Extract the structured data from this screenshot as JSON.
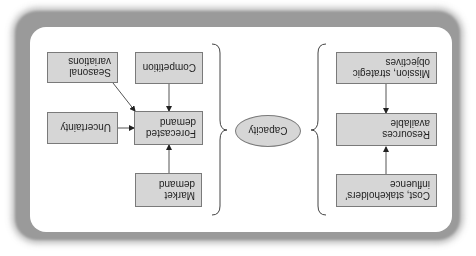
{
  "diagram": {
    "orientation": "rotated 180 degrees",
    "center": {
      "label": "Capacity"
    },
    "supply_side": {
      "boxes": [
        {
          "id": "mission",
          "label": "Mission, strategic objectives"
        },
        {
          "id": "resources",
          "label": "Resources available"
        },
        {
          "id": "cost",
          "label": "Cost, stakeholders' influence"
        }
      ]
    },
    "demand_side": {
      "boxes": [
        {
          "id": "competition",
          "label": "Competition"
        },
        {
          "id": "seasonal",
          "label": "Seasonal variations"
        },
        {
          "id": "uncertainty",
          "label": "Uncertainty"
        },
        {
          "id": "forecasted",
          "label": "Forecasted demand"
        },
        {
          "id": "market",
          "label": "Market demand"
        }
      ]
    },
    "arrows": [
      {
        "from": "Mission, strategic objectives",
        "to": "Resources available"
      },
      {
        "from": "Cost, stakeholders' influence",
        "to": "Resources available"
      },
      {
        "from": "Competition",
        "to": "Forecasted demand"
      },
      {
        "from": "Seasonal variations",
        "to": "Forecasted demand"
      },
      {
        "from": "Uncertainty",
        "to": "Forecasted demand"
      },
      {
        "from": "Market demand",
        "to": "Forecasted demand"
      }
    ],
    "colors": {
      "box_fill": "#d6d6d6",
      "box_border": "#7a7a7a",
      "text": "#1e1e1e",
      "frame_shadow": "#9a9a9a"
    }
  }
}
